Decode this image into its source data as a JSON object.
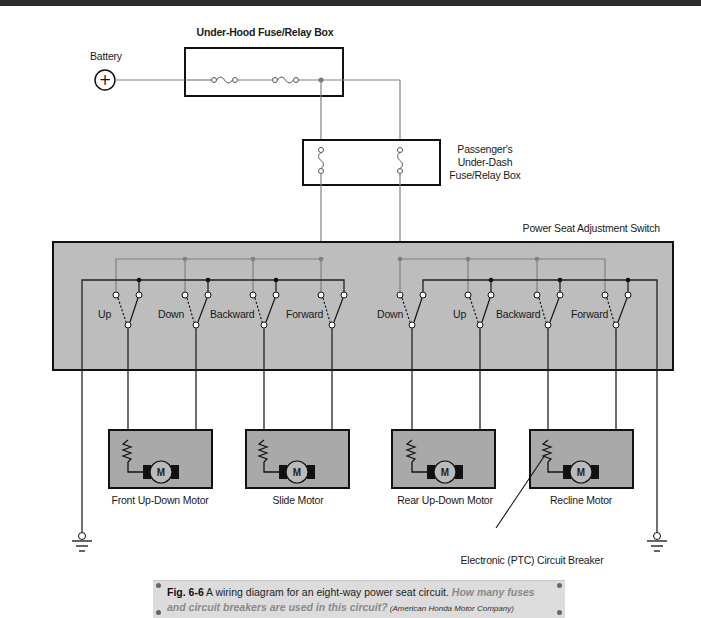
{
  "header": {
    "title": ""
  },
  "diagram": {
    "battery_label": "Battery",
    "battery_symbol": "+",
    "underhood_box_label": "Under-Hood Fuse/Relay Box",
    "underdash_box_label_lines": [
      "Passenger's",
      "Under-Dash",
      "Fuse/Relay Box"
    ],
    "switch_box_label": "Power Seat Adjustment Switch",
    "switch_labels": [
      "Up",
      "Down",
      "Backward",
      "Forward",
      "Down",
      "Up",
      "Backward",
      "Forward"
    ],
    "motor_symbol": "M",
    "motors": [
      {
        "label": "Front Up-Down Motor"
      },
      {
        "label": "Slide Motor"
      },
      {
        "label": "Rear Up-Down Motor"
      },
      {
        "label": "Recline Motor"
      }
    ],
    "ptc_label": "Electronic (PTC) Circuit Breaker",
    "colors": {
      "switch_box_fill": "#bdbdbd",
      "motor_box_fill": "#a9a9a9",
      "power_wire": "#808080",
      "ground_wire": "#222222"
    }
  },
  "caption": {
    "fig_number": "Fig. 6-6",
    "text": " A wiring diagram for an eight-way power seat circuit. ",
    "question": "How many fuses and circuit breakers are used in this circuit?",
    "credit": " (American Honda Motor Company)"
  }
}
